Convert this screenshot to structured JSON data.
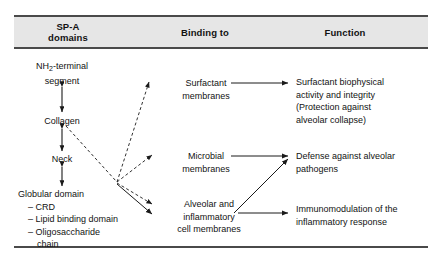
{
  "figure": {
    "columns": [
      {
        "id": "sp-a-domains",
        "title_line1": "SP-A",
        "title_line2": "domains"
      },
      {
        "id": "binding-to",
        "title": "Binding to"
      },
      {
        "id": "function",
        "title": "Function"
      }
    ],
    "domains": [
      {
        "id": "nh2-terminal-segment",
        "line1": "NH",
        "sub": "2",
        "line1b": "-terminal",
        "line2": "segment"
      },
      {
        "id": "collagen",
        "label": "Collagen"
      },
      {
        "id": "neck",
        "label": "Neck"
      },
      {
        "id": "globular-domain",
        "label": "Globular domain",
        "items": [
          "– CRD",
          "– Lipid binding domain",
          "– Oligosaccharide",
          "chain"
        ]
      }
    ],
    "binding_targets": [
      {
        "id": "surfactant-membranes",
        "line1": "Surfactant",
        "line2": "membranes"
      },
      {
        "id": "microbial-membranes",
        "line1": "Microbial",
        "line2": "membranes"
      },
      {
        "id": "alveolar-inflammatory-cell-membranes",
        "line1": "Alveolar and",
        "line2": "inflammatory",
        "line3": "cell membranes"
      }
    ],
    "functions": [
      {
        "id": "surfactant-biophysical-activity",
        "line1": "Surfactant biophysical",
        "line2": "activity and integrity",
        "line3": "(Protection against",
        "line4": "alveolar collapse)"
      },
      {
        "id": "defense-against-alveolar-pathogens",
        "line1": "Defense against alveolar",
        "line2": "pathogens"
      },
      {
        "id": "immunomodulation-inflammatory-response",
        "line1": "Immunomodulation of the",
        "line2": "inflammatory response"
      }
    ],
    "colors": {
      "text": "#121212",
      "rule": "#4a4a4a",
      "header_band": "#e6e6e6",
      "arrow": "#1a1a1a"
    }
  }
}
